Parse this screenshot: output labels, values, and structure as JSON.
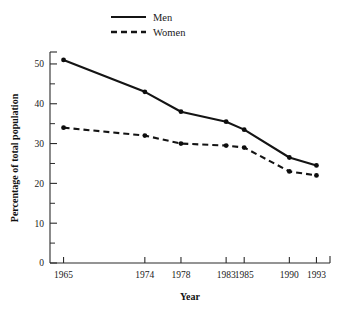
{
  "chart_data": {
    "type": "line",
    "title": "",
    "xlabel": "Year",
    "ylabel": "Percentage of total population",
    "x": [
      1965,
      1974,
      1978,
      1983,
      1985,
      1990,
      1993
    ],
    "categories": [
      "1965",
      "1974",
      "1978",
      "1983",
      "1985",
      "1990",
      "1993"
    ],
    "series": [
      {
        "name": "Men",
        "style": "solid",
        "values": [
          51,
          43,
          38,
          35.5,
          33.5,
          26.5,
          24.5
        ]
      },
      {
        "name": "Women",
        "style": "dashed",
        "values": [
          34,
          32,
          30,
          29.5,
          29,
          23,
          22
        ]
      }
    ],
    "ylim": [
      0,
      53
    ],
    "yticks": [
      0,
      10,
      20,
      30,
      40,
      50
    ],
    "yticklabels": [
      "0",
      "10",
      "20",
      "30",
      "40",
      "50"
    ],
    "yminorticks": [
      5,
      15,
      25,
      35,
      45
    ],
    "xlim": [
      1963.5,
      1994.5
    ],
    "grid": false,
    "legend_position": "top-center",
    "line_color": "#141414"
  },
  "legend": {
    "entries": [
      {
        "label": "Men"
      },
      {
        "label": "Women"
      }
    ]
  },
  "axes": {
    "x_title": "Year",
    "y_title": "Percentage of total population"
  }
}
